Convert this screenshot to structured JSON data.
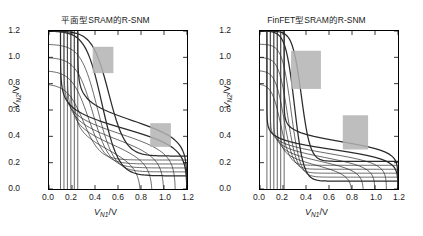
{
  "figure": {
    "width": 423,
    "height": 236,
    "background": "#ffffff",
    "curve_color": "#2b2b2b",
    "snm_box_color": "#b3b3b3"
  },
  "panels": [
    {
      "id": "planar",
      "title": "平面型SRAM的R-SNM",
      "axis": {
        "xlabel_main": "V",
        "xlabel_sub": "N1",
        "xlabel_unit": "/V",
        "ylabel_main": "V",
        "ylabel_sub": "N2",
        "ylabel_unit": "/V",
        "xticks": [
          "0.0",
          "0.2",
          "0.4",
          "0.6",
          "0.8",
          "1.0",
          "1.2"
        ],
        "yticks": [
          "0.0",
          "0.2",
          "0.4",
          "0.6",
          "0.8",
          "1.0",
          "1.2"
        ],
        "xlim": [
          0.0,
          1.2
        ],
        "ylim": [
          0.0,
          1.2
        ]
      }
    },
    {
      "id": "finfet",
      "title": "FinFET型SRAM的R-SNM",
      "axis": {
        "xlabel_main": "V",
        "xlabel_sub": "N1",
        "xlabel_unit": "/V",
        "ylabel_main": "V",
        "ylabel_sub": "N2",
        "ylabel_unit": "/V",
        "xticks": [
          "0.0",
          "0.2",
          "0.4",
          "0.6",
          "0.8",
          "1.0",
          "1.2"
        ],
        "yticks": [
          "0.0",
          "0.2",
          "0.4",
          "0.6",
          "0.8",
          "1.0",
          "1.2"
        ],
        "xlim": [
          0.0,
          1.2
        ],
        "ylim": [
          0.0,
          1.2
        ]
      }
    }
  ],
  "chart_data": [
    {
      "type": "line",
      "id": "planar",
      "title": "平面型SRAM的R-SNM",
      "xlabel": "V_N1/V",
      "ylabel": "V_N2/V",
      "xlim": [
        0.0,
        1.2
      ],
      "ylim": [
        0.0,
        1.2
      ],
      "grid": false,
      "legend": "none",
      "description": "Butterfly plot: read-mode voltage transfer characteristic families for a planar SRAM cell; two mirrored curve families overlap and enclose two SNM squares.",
      "series": [
        {
          "name": "VTC-A-1",
          "plateau_high": 1.2,
          "transition_x": 0.46,
          "plateau_low": 0.1
        },
        {
          "name": "VTC-A-2",
          "plateau_high": 1.1,
          "transition_x": 0.42,
          "plateau_low": 0.13
        },
        {
          "name": "VTC-A-3",
          "plateau_high": 1.0,
          "transition_x": 0.38,
          "plateau_low": 0.16
        },
        {
          "name": "VTC-A-4",
          "plateau_high": 0.9,
          "transition_x": 0.34,
          "plateau_low": 0.19
        },
        {
          "name": "VTC-A-5",
          "plateau_high": 0.8,
          "transition_x": 0.3,
          "plateau_low": 0.22
        },
        {
          "name": "VTC-A-6",
          "plateau_high": 1.2,
          "transition_x": 0.52,
          "plateau_low": 0.25
        },
        {
          "name": "VTC-B-1",
          "plateau_high": 1.2,
          "transition_x": 0.46,
          "plateau_low": 0.1
        },
        {
          "name": "VTC-B-2",
          "plateau_high": 1.1,
          "transition_x": 0.42,
          "plateau_low": 0.13
        },
        {
          "name": "VTC-B-3",
          "plateau_high": 1.0,
          "transition_x": 0.38,
          "plateau_low": 0.16
        },
        {
          "name": "VTC-B-4",
          "plateau_high": 0.9,
          "transition_x": 0.34,
          "plateau_low": 0.19
        },
        {
          "name": "VTC-B-5",
          "plateau_high": 0.8,
          "transition_x": 0.3,
          "plateau_low": 0.22
        },
        {
          "name": "VTC-B-6",
          "plateau_high": 1.2,
          "transition_x": 0.52,
          "plateau_low": 0.25
        }
      ],
      "snm_squares": [
        {
          "name": "upper-left-snm",
          "x": 0.38,
          "y": 0.88,
          "width": 0.18,
          "height": 0.2
        },
        {
          "name": "lower-right-snm",
          "x": 0.88,
          "y": 0.32,
          "width": 0.18,
          "height": 0.18
        }
      ]
    },
    {
      "type": "line",
      "id": "finfet",
      "title": "FinFET型SRAM的R-SNM",
      "xlabel": "V_N1/V",
      "ylabel": "V_N2/V",
      "xlim": [
        0.0,
        1.2
      ],
      "ylim": [
        0.0,
        1.2
      ],
      "grid": false,
      "legend": "none",
      "description": "Butterfly plot: read-mode voltage transfer characteristic families for a FinFET SRAM cell; sharper transitions give larger enclosed SNM squares.",
      "series": [
        {
          "name": "VTC-A-1",
          "plateau_high": 1.2,
          "transition_x": 0.3,
          "plateau_low": 0.06
        },
        {
          "name": "VTC-A-2",
          "plateau_high": 1.1,
          "transition_x": 0.27,
          "plateau_low": 0.09
        },
        {
          "name": "VTC-A-3",
          "plateau_high": 1.0,
          "transition_x": 0.24,
          "plateau_low": 0.12
        },
        {
          "name": "VTC-A-4",
          "plateau_high": 0.9,
          "transition_x": 0.21,
          "plateau_low": 0.15
        },
        {
          "name": "VTC-A-5",
          "plateau_high": 0.8,
          "transition_x": 0.18,
          "plateau_low": 0.18
        },
        {
          "name": "VTC-A-6",
          "plateau_high": 1.2,
          "transition_x": 0.36,
          "plateau_low": 0.21
        },
        {
          "name": "VTC-B-1",
          "plateau_high": 1.2,
          "transition_x": 0.3,
          "plateau_low": 0.06
        },
        {
          "name": "VTC-B-2",
          "plateau_high": 1.1,
          "transition_x": 0.27,
          "plateau_low": 0.09
        },
        {
          "name": "VTC-B-3",
          "plateau_high": 1.0,
          "transition_x": 0.24,
          "plateau_low": 0.12
        },
        {
          "name": "VTC-B-4",
          "plateau_high": 0.9,
          "transition_x": 0.21,
          "plateau_low": 0.15
        },
        {
          "name": "VTC-B-5",
          "plateau_high": 0.8,
          "transition_x": 0.18,
          "plateau_low": 0.18
        },
        {
          "name": "VTC-B-6",
          "plateau_high": 1.2,
          "transition_x": 0.36,
          "plateau_low": 0.21
        }
      ],
      "snm_squares": [
        {
          "name": "upper-left-snm",
          "x": 0.27,
          "y": 0.76,
          "width": 0.26,
          "height": 0.29
        },
        {
          "name": "lower-right-snm",
          "x": 0.72,
          "y": 0.3,
          "width": 0.22,
          "height": 0.26
        }
      ]
    }
  ]
}
